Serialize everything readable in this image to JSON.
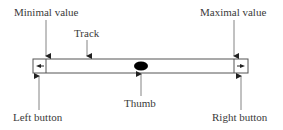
{
  "diagram": {
    "labels": {
      "minimal_value": "Minimal value",
      "maximal_value": "Maximal value",
      "track": "Track",
      "thumb": "Thumb",
      "left_button": "Left button",
      "right_button": "Right button"
    },
    "icons": {
      "left_button_glyph": "arrow-left-icon",
      "right_button_glyph": "arrow-right-icon",
      "thumb_glyph": "ellipse"
    },
    "colors": {
      "stroke": "#555555",
      "thumb": "#000000",
      "background": "#ffffff"
    }
  }
}
